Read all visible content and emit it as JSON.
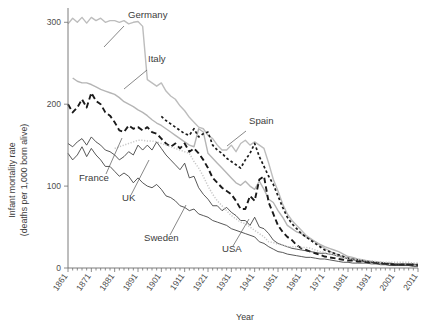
{
  "chart_data": {
    "type": "line",
    "title": "",
    "subtitle": "",
    "xlabel": "Year",
    "ylabel": "Infant mortality rate\n(deaths per 1,000 born alive)",
    "ylabel_line1": "Infant mortality rate",
    "ylabel_line2": "(deaths per 1,000 born alive)",
    "xlim": [
      1861,
      2011
    ],
    "ylim": [
      0,
      315
    ],
    "yticks": [
      0,
      100,
      200,
      300
    ],
    "ytick_labels": [
      "0",
      "100",
      "200",
      "300"
    ],
    "xticks": [
      1861,
      1871,
      1881,
      1891,
      1901,
      1911,
      1921,
      1931,
      1941,
      1951,
      1961,
      1971,
      1981,
      1991,
      2001,
      2011
    ],
    "xtick_labels": [
      "1861",
      "1871",
      "1881",
      "1891",
      "1901",
      "1911",
      "1921",
      "1931",
      "1941",
      "1951",
      "1961",
      "1971",
      "1981",
      "1991",
      "2001",
      "2011"
    ],
    "xtick_minor_step": 2,
    "grid": false,
    "legend": "inline-annotations",
    "annotations": [
      {
        "label": "Germany",
        "x": 128,
        "y": 18,
        "leader_from": [
          124,
          26
        ],
        "leader_to": [
          104,
          47
        ]
      },
      {
        "label": "Italy",
        "x": 148,
        "y": 62,
        "leader_from": [
          147,
          70
        ],
        "leader_to": [
          124,
          89
        ]
      },
      {
        "label": "Spain",
        "x": 249,
        "y": 124,
        "leader_from": [
          246,
          131
        ],
        "leader_to": [
          227,
          146
        ]
      },
      {
        "label": "France",
        "x": 79,
        "y": 181,
        "leader_from": [
          106,
          174
        ],
        "leader_to": [
          122,
          138
        ]
      },
      {
        "label": "UK",
        "x": 122,
        "y": 201,
        "leader_from": [
          131,
          195
        ],
        "leader_to": [
          149,
          160
        ]
      },
      {
        "label": "Sweden",
        "x": 144,
        "y": 241,
        "leader_from": [
          170,
          235
        ],
        "leader_to": [
          186,
          205
        ]
      },
      {
        "label": "USA",
        "x": 222,
        "y": 252,
        "leader_from": [
          233,
          246
        ],
        "leader_to": [
          249,
          219
        ]
      }
    ],
    "series": [
      {
        "name": "Germany",
        "style": "solid",
        "color": "#bdbdbd",
        "width": 1.4,
        "x": [
          1861,
          1863,
          1865,
          1867,
          1869,
          1871,
          1873,
          1875,
          1877,
          1879,
          1881,
          1883,
          1885,
          1887,
          1889,
          1891,
          1893,
          1895,
          1897,
          1899,
          1901,
          1903,
          1905,
          1907,
          1909,
          1911,
          1913,
          1915,
          1917,
          1919,
          1921,
          1923,
          1925,
          1927,
          1929,
          1931,
          1933,
          1935,
          1937,
          1939,
          1941,
          1943,
          1945,
          1947,
          1949,
          1951,
          1953,
          1955,
          1957,
          1959,
          1961,
          1963,
          1965,
          1967,
          1969,
          1971,
          1973,
          1975,
          1977,
          1979,
          1981,
          1983,
          1985,
          1987,
          1989,
          1991,
          1993,
          1995,
          1997,
          1999,
          2001,
          2003,
          2005,
          2007,
          2009,
          2011
        ],
        "y": [
          298,
          305,
          300,
          306,
          299,
          306,
          302,
          305,
          300,
          302,
          302,
          300,
          302,
          298,
          300,
          301,
          295,
          230,
          226,
          222,
          226,
          216,
          210,
          206,
          198,
          192,
          184,
          178,
          172,
          170,
          162,
          158,
          150,
          144,
          144,
          150,
          142,
          152,
          156,
          150,
          154,
          150,
          146,
          128,
          108,
          94,
          78,
          66,
          58,
          52,
          46,
          40,
          36,
          32,
          28,
          24,
          21,
          18,
          16,
          14,
          12,
          11,
          10,
          9,
          8,
          7,
          6,
          6,
          5,
          5,
          4,
          4,
          4,
          4,
          4,
          4
        ]
      },
      {
        "name": "Italy",
        "style": "solid",
        "color": "#b5b5b5",
        "width": 1.4,
        "x": [
          1863,
          1865,
          1867,
          1869,
          1871,
          1873,
          1875,
          1877,
          1879,
          1881,
          1883,
          1885,
          1887,
          1889,
          1891,
          1893,
          1895,
          1897,
          1899,
          1901,
          1903,
          1905,
          1907,
          1909,
          1911,
          1913,
          1915,
          1917,
          1919,
          1921,
          1923,
          1925,
          1927,
          1929,
          1931,
          1933,
          1935,
          1937,
          1939,
          1941,
          1943,
          1945,
          1947,
          1949,
          1951,
          1953,
          1955,
          1957,
          1959,
          1961,
          1963,
          1965,
          1967,
          1969,
          1971,
          1973,
          1975,
          1977,
          1979,
          1981,
          1983,
          1985,
          1987,
          1989,
          1991,
          1993,
          1995,
          1997,
          1999,
          2001,
          2003,
          2005,
          2007,
          2009,
          2011
        ],
        "y": [
          232,
          228,
          226,
          226,
          224,
          221,
          218,
          216,
          214,
          212,
          208,
          203,
          200,
          197,
          193,
          190,
          186,
          181,
          177,
          174,
          170,
          166,
          162,
          158,
          154,
          150,
          148,
          170,
          166,
          140,
          134,
          128,
          122,
          116,
          110,
          104,
          101,
          106,
          100,
          96,
          106,
          96,
          84,
          80,
          70,
          62,
          52,
          48,
          44,
          42,
          38,
          35,
          32,
          29,
          26,
          24,
          22,
          20,
          17,
          14,
          13,
          11,
          10,
          9,
          8,
          7,
          7,
          6,
          5,
          4,
          4,
          4,
          4,
          3,
          3
        ]
      },
      {
        "name": "Spain",
        "style": "dotted",
        "color": "#1a1a1a",
        "width": 1.7,
        "dash": "2.6 2.4",
        "x": [
          1901,
          1903,
          1905,
          1907,
          1909,
          1911,
          1913,
          1915,
          1917,
          1919,
          1921,
          1923,
          1925,
          1927,
          1929,
          1931,
          1933,
          1935,
          1937,
          1939,
          1941,
          1943,
          1945,
          1947,
          1949,
          1951,
          1953,
          1955,
          1957,
          1959,
          1961,
          1963,
          1965,
          1967,
          1969,
          1971,
          1973,
          1975,
          1977,
          1979,
          1981,
          1983,
          1985,
          1987,
          1989,
          1991,
          1993,
          1995,
          1997,
          1999,
          2001,
          2003,
          2005,
          2007,
          2009,
          2011
        ],
        "y": [
          185,
          180,
          176,
          172,
          168,
          164,
          162,
          170,
          160,
          164,
          166,
          150,
          144,
          140,
          134,
          130,
          126,
          122,
          132,
          140,
          152,
          136,
          124,
          112,
          102,
          88,
          74,
          62,
          54,
          48,
          42,
          38,
          34,
          30,
          26,
          22,
          20,
          18,
          16,
          14,
          12,
          11,
          10,
          9,
          8,
          7,
          7,
          6,
          5,
          5,
          4,
          4,
          4,
          4,
          4,
          4
        ]
      },
      {
        "name": "France",
        "style": "dashed",
        "color": "#1a1a1a",
        "width": 1.9,
        "dash": "5.5 3.2",
        "x": [
          1861,
          1863,
          1865,
          1867,
          1869,
          1871,
          1873,
          1875,
          1877,
          1879,
          1881,
          1883,
          1885,
          1887,
          1889,
          1891,
          1893,
          1895,
          1897,
          1899,
          1901,
          1903,
          1905,
          1907,
          1909,
          1911,
          1913,
          1915,
          1917,
          1919,
          1921,
          1923,
          1925,
          1927,
          1929,
          1931,
          1933,
          1935,
          1937,
          1939,
          1941,
          1943,
          1945,
          1947,
          1949,
          1951,
          1953,
          1955,
          1957,
          1959,
          1961,
          1963,
          1965,
          1967,
          1969,
          1971,
          1973,
          1975,
          1977,
          1979,
          1981,
          1983,
          1985,
          1987,
          1989,
          1991,
          1993,
          1995,
          1997,
          1999,
          2001,
          2003,
          2005,
          2007,
          2009,
          2011
        ],
        "y": [
          200,
          190,
          196,
          206,
          196,
          214,
          204,
          200,
          190,
          186,
          178,
          168,
          166,
          174,
          170,
          172,
          168,
          172,
          166,
          164,
          158,
          152,
          148,
          152,
          146,
          152,
          142,
          146,
          140,
          132,
          122,
          110,
          104,
          98,
          94,
          90,
          82,
          72,
          72,
          88,
          82,
          108,
          112,
          80,
          66,
          52,
          44,
          38,
          34,
          28,
          24,
          22,
          20,
          18,
          16,
          14,
          13,
          12,
          11,
          10,
          9,
          9,
          8,
          8,
          7,
          7,
          6,
          6,
          5,
          5,
          4,
          4,
          4,
          4,
          4,
          4
        ]
      },
      {
        "name": "UK",
        "style": "solid",
        "color": "#3a3a3a",
        "width": 0.85,
        "x": [
          1861,
          1863,
          1865,
          1867,
          1869,
          1871,
          1873,
          1875,
          1877,
          1879,
          1881,
          1883,
          1885,
          1887,
          1889,
          1891,
          1893,
          1895,
          1897,
          1899,
          1901,
          1903,
          1905,
          1907,
          1909,
          1911,
          1913,
          1915,
          1917,
          1919,
          1921,
          1923,
          1925,
          1927,
          1929,
          1931,
          1933,
          1935,
          1937,
          1939,
          1941,
          1943,
          1945,
          1947,
          1949,
          1951,
          1953,
          1955,
          1957,
          1959,
          1961,
          1963,
          1965,
          1967,
          1969,
          1971,
          1973,
          1975,
          1977,
          1979,
          1981,
          1983,
          1985,
          1987,
          1989,
          1991,
          1993,
          1995,
          1997,
          1999,
          2001,
          2003,
          2005,
          2007,
          2009,
          2011
        ],
        "y": [
          152,
          148,
          154,
          158,
          150,
          160,
          154,
          150,
          144,
          142,
          138,
          132,
          136,
          142,
          138,
          150,
          144,
          150,
          144,
          154,
          146,
          138,
          132,
          126,
          120,
          128,
          110,
          112,
          98,
          90,
          84,
          76,
          76,
          70,
          74,
          68,
          64,
          58,
          58,
          52,
          62,
          50,
          48,
          42,
          34,
          30,
          28,
          26,
          24,
          23,
          22,
          21,
          20,
          19,
          18,
          18,
          17,
          16,
          14,
          13,
          11,
          10,
          9,
          9,
          8,
          7,
          6,
          6,
          6,
          6,
          5,
          5,
          5,
          5,
          5,
          4
        ]
      },
      {
        "name": "Sweden",
        "style": "solid",
        "color": "#3a3a3a",
        "width": 0.85,
        "x": [
          1861,
          1863,
          1865,
          1867,
          1869,
          1871,
          1873,
          1875,
          1877,
          1879,
          1881,
          1883,
          1885,
          1887,
          1889,
          1891,
          1893,
          1895,
          1897,
          1899,
          1901,
          1903,
          1905,
          1907,
          1909,
          1911,
          1913,
          1915,
          1917,
          1919,
          1921,
          1923,
          1925,
          1927,
          1929,
          1931,
          1933,
          1935,
          1937,
          1939,
          1941,
          1943,
          1945,
          1947,
          1949,
          1951,
          1953,
          1955,
          1957,
          1959,
          1961,
          1963,
          1965,
          1967,
          1969,
          1971,
          1973,
          1975,
          1977,
          1979,
          1981,
          1983,
          1985,
          1987,
          1989,
          1991,
          1993,
          1995,
          1997,
          1999,
          2001,
          2003,
          2005,
          2007,
          2009,
          2011
        ],
        "y": [
          140,
          132,
          138,
          148,
          136,
          146,
          138,
          132,
          124,
          124,
          118,
          112,
          116,
          112,
          104,
          110,
          104,
          100,
          98,
          102,
          96,
          88,
          86,
          82,
          76,
          74,
          70,
          72,
          66,
          64,
          62,
          58,
          56,
          54,
          52,
          48,
          46,
          44,
          42,
          40,
          38,
          32,
          30,
          26,
          23,
          20,
          19,
          17,
          16,
          15,
          14,
          13,
          13,
          12,
          11,
          11,
          10,
          9,
          8,
          7,
          7,
          6,
          6,
          6,
          6,
          5,
          5,
          4,
          4,
          3,
          3,
          3,
          3,
          3,
          2,
          2
        ]
      },
      {
        "name": "USA",
        "style": "dotted-fine",
        "color": "#c8c8c8",
        "width": 1.5,
        "dash": "1.2 1.6",
        "x": [
          1881,
          1883,
          1885,
          1887,
          1889,
          1891,
          1893,
          1895,
          1897,
          1899,
          1901,
          1903,
          1905,
          1907,
          1909,
          1911,
          1913,
          1915,
          1917,
          1919,
          1921,
          1923,
          1925,
          1927,
          1929,
          1931,
          1933,
          1935,
          1937,
          1939,
          1941,
          1943,
          1945,
          1947,
          1949,
          1951,
          1953,
          1955,
          1957,
          1959,
          1961,
          1963,
          1965,
          1967,
          1969,
          1971,
          1973,
          1975,
          1977,
          1979,
          1981,
          1983,
          1985,
          1987,
          1989,
          1991,
          1993,
          1995,
          1997,
          1999,
          2001,
          2003,
          2005,
          2007,
          2009,
          2011
        ],
        "y": [
          146,
          148,
          150,
          152,
          154,
          156,
          156,
          155,
          155,
          154,
          152,
          150,
          148,
          146,
          144,
          142,
          140,
          130,
          122,
          112,
          100,
          90,
          82,
          76,
          70,
          64,
          60,
          56,
          54,
          50,
          46,
          42,
          38,
          32,
          31,
          29,
          28,
          26,
          26,
          26,
          25,
          25,
          24,
          22,
          20,
          19,
          17,
          16,
          14,
          13,
          12,
          11,
          10,
          10,
          9,
          9,
          8,
          7,
          7,
          7,
          7,
          7,
          7,
          7,
          6,
          6
        ]
      }
    ]
  }
}
